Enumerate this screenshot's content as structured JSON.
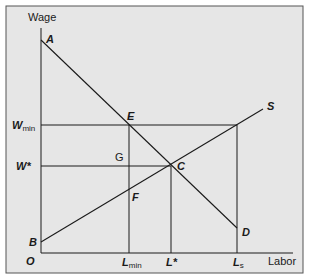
{
  "diagram": {
    "type": "labor-market-minimum-wage",
    "background_color": "#e6e6e6",
    "line_color": "#1a1a1a",
    "axes": {
      "y_label": "Wage",
      "x_label": "Labor",
      "origin_label": "O"
    },
    "y_ticks": [
      {
        "main": "W",
        "sub": "min",
        "name": "minimum-wage"
      },
      {
        "main": "W*",
        "sub": "",
        "name": "equilibrium-wage"
      }
    ],
    "x_ticks": [
      {
        "main": "L",
        "sub": "min",
        "name": "labor-at-minimum-wage"
      },
      {
        "main": "L*",
        "sub": "",
        "name": "equilibrium-labor"
      },
      {
        "main": "L",
        "sub": "s",
        "name": "labor-supplied"
      }
    ],
    "curves": [
      {
        "name": "demand",
        "label": "",
        "from_point": "A",
        "to_point": "D"
      },
      {
        "name": "supply",
        "label": "S",
        "from_point": "B",
        "to_point": "S"
      }
    ],
    "points": {
      "A": "A",
      "B": "B",
      "C": "C",
      "D": "D",
      "E": "E",
      "F": "F",
      "G": "G"
    }
  }
}
